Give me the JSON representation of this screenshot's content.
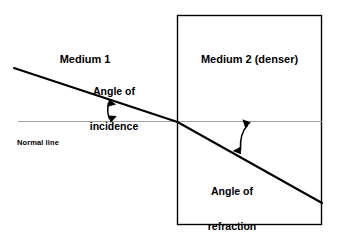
{
  "diagram": {
    "background_color": "#ffffff",
    "stroke_color": "#000000",
    "normal_line_color": "#999999",
    "labels": {
      "medium_1": "Medium 1",
      "medium_2": "Medium 2 (denser)",
      "angle_of_incidence_line1": "Angle of",
      "angle_of_incidence_line2": "incidence",
      "angle_of_refraction_line1": "Angle of",
      "angle_of_refraction_line2": "refraction",
      "normal_line": "Normal line"
    },
    "geometry": {
      "medium2_box": {
        "x": 177,
        "y": 15,
        "width": 145,
        "height": 210
      },
      "normal_line": {
        "x1": 18,
        "y1": 121,
        "x2": 322,
        "y2": 121
      },
      "incident_ray": {
        "x1": 14,
        "y1": 68,
        "x2": 177,
        "y2": 122
      },
      "refracted_ray": {
        "x1": 177,
        "y1": 122,
        "x2": 322,
        "y2": 203
      },
      "incidence_arc_arrow": {
        "x1": 108,
        "y1": 101,
        "x2": 110,
        "y2": 121
      },
      "refraction_arc_arrow": {
        "x1": 240,
        "y1": 152,
        "x2": 248,
        "y2": 122
      }
    }
  }
}
